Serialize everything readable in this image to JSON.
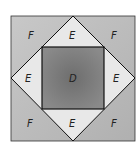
{
  "diagram": {
    "type": "nested-squares",
    "regions": {
      "corners": [
        "F",
        "F",
        "F",
        "F"
      ],
      "triangles": [
        "E",
        "E",
        "E",
        "E"
      ],
      "center": "D"
    },
    "labels": {
      "f_tl": "F",
      "f_tr": "F",
      "f_bl": "F",
      "f_br": "F",
      "e_top": "E",
      "e_left": "E",
      "e_right": "E",
      "e_bottom": "E",
      "d_center": "D"
    },
    "colors": {
      "corner_fill": "#bdbdbd",
      "triangle_fill": "#e6e6e6",
      "center_fill": "#7a7a7a",
      "stroke": "#111111"
    }
  }
}
